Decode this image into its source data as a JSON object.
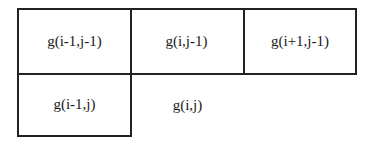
{
  "diagram": {
    "cells": [
      {
        "label": "g(i-1,j-1)",
        "row": 0,
        "col": 0,
        "bordered": true
      },
      {
        "label": "g(i,j-1)",
        "row": 0,
        "col": 1,
        "bordered": true
      },
      {
        "label": "g(i+1,j-1)",
        "row": 0,
        "col": 2,
        "bordered": true
      },
      {
        "label": "g(i-1,j)",
        "row": 1,
        "col": 0,
        "bordered": true
      },
      {
        "label": "g(i,j)",
        "row": 1,
        "col": 1,
        "bordered": false
      }
    ]
  }
}
